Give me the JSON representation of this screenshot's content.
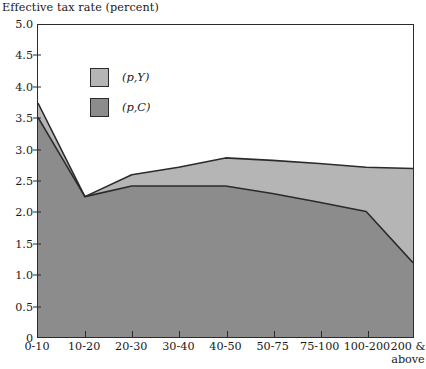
{
  "chart_data": {
    "type": "area",
    "title": "",
    "ylabel": "Effective tax rate (percent)",
    "xlabel": "",
    "ylim": [
      0,
      5.0
    ],
    "y_ticks": [
      "0",
      "0.5",
      "1.0",
      "1.5",
      "2.0",
      "2.5",
      "3.0",
      "3.5",
      "4.0",
      "4.5",
      "5.0"
    ],
    "y_tick_values": [
      0,
      0.5,
      1.0,
      1.5,
      2.0,
      2.5,
      3.0,
      3.5,
      4.0,
      4.5,
      5.0
    ],
    "grid": false,
    "legend_position": "upper-left",
    "categories": [
      "0-10",
      "10-20",
      "20-30",
      "30-40",
      "40-50",
      "50-75",
      "75-100",
      "100-200",
      "200 & above"
    ],
    "series": [
      {
        "name": "(p,Y)",
        "color": "#b5b5b5",
        "values": [
          3.75,
          2.25,
          2.6,
          2.72,
          2.87,
          2.83,
          2.78,
          2.72,
          2.7
        ]
      },
      {
        "name": "(p,C)",
        "color": "#8c8c8c",
        "values": [
          3.52,
          2.25,
          2.42,
          2.42,
          2.42,
          2.3,
          2.16,
          2.01,
          1.19
        ]
      }
    ],
    "annotations": []
  },
  "legend": {
    "items": [
      {
        "label": "(p,Y)",
        "color": "#b5b5b5"
      },
      {
        "label": "(p,C)",
        "color": "#8c8c8c"
      }
    ]
  },
  "axes": {
    "y_title": "Effective tax rate (percent)",
    "x_labels": [
      "0-10",
      "10-20",
      "20-30",
      "30-40",
      "40-50",
      "50-75",
      "75-100",
      "100-200",
      "200 &\nabove"
    ],
    "x_label_last_line1": "200 &",
    "x_label_last_line2": "above"
  },
  "colors": {
    "series_py": "#b5b5b5",
    "series_pc": "#8c8c8c",
    "axis": "#2b2b2b",
    "background": "#ffffff"
  }
}
